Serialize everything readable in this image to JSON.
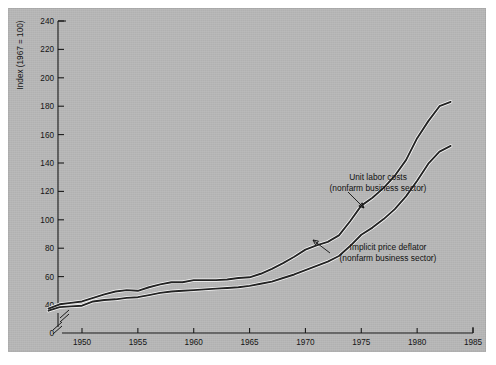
{
  "figure": {
    "background_color": "#b4b4b4",
    "page_color": "#ffffff"
  },
  "chart_data": {
    "type": "line",
    "title": "",
    "subtitle": "",
    "xlabel": "",
    "ylabel": "Index (1967 = 100)",
    "xlim": [
      1947,
      1985
    ],
    "ylim": [
      40,
      240
    ],
    "y_axis_break": true,
    "y_axis_break_label": "0",
    "grid": false,
    "legend": "none",
    "xticks": [
      1950,
      1955,
      1960,
      1965,
      1970,
      1975,
      1980,
      1985
    ],
    "xtick_labels": [
      "1950",
      "1955",
      "1960",
      "1965",
      "1970",
      "1975",
      "1980",
      "1985"
    ],
    "yticks": [
      40,
      60,
      80,
      100,
      120,
      140,
      160,
      180,
      200,
      220,
      240
    ],
    "ytick_labels": [
      "40",
      "60",
      "80",
      "100",
      "120",
      "140",
      "160",
      "180",
      "200",
      "220",
      "240"
    ],
    "zero_tick_label": "0",
    "x": [
      1947,
      1948,
      1949,
      1950,
      1951,
      1952,
      1953,
      1954,
      1955,
      1956,
      1957,
      1958,
      1959,
      1960,
      1961,
      1962,
      1963,
      1964,
      1965,
      1966,
      1967,
      1968,
      1969,
      1970,
      1971,
      1972,
      1973,
      1974,
      1975,
      1976,
      1977,
      1978,
      1979,
      1980,
      1981,
      1982,
      1983
    ],
    "series": [
      {
        "name": "Unit labor costs (nonfarm business sector)",
        "style": "white-highlighted dark line (upper)",
        "values": [
          37.5,
          40.5,
          41.5,
          42.5,
          45.0,
          47.5,
          49.5,
          50.5,
          50.0,
          52.5,
          54.5,
          56.0,
          56.0,
          57.5,
          57.5,
          57.5,
          58.0,
          59.0,
          59.5,
          62.0,
          65.5,
          69.5,
          74.0,
          79.0,
          82.0,
          84.5,
          89.0,
          99.0,
          110.0,
          115.5,
          122.5,
          131.0,
          142.0,
          157.5,
          169.5,
          180.0,
          183.0
        ]
      },
      {
        "name": "Implicit price deflator (nonfarm business sector)",
        "style": "dark line (lower)",
        "values": [
          36.0,
          38.5,
          39.0,
          39.5,
          42.5,
          43.5,
          44.0,
          45.0,
          45.5,
          47.0,
          48.5,
          49.5,
          50.0,
          50.5,
          51.0,
          51.5,
          52.0,
          52.5,
          53.5,
          55.0,
          56.5,
          59.0,
          61.5,
          64.5,
          67.5,
          70.5,
          74.5,
          81.5,
          89.5,
          94.5,
          100.5,
          107.5,
          116.5,
          127.5,
          139.5,
          148.0,
          152.0
        ]
      }
    ],
    "annotations": [
      {
        "id": "unit-labor-costs",
        "line1": "Unit labor costs",
        "line2": "(nonfarm business sector)",
        "text_x": 378,
        "text_y": 180,
        "arrow_from_x": 348,
        "arrow_from_y": 192,
        "arrow_to_x": 364,
        "arrow_to_y": 208
      },
      {
        "id": "implicit-price-deflator",
        "line1": "Implicit price deflator",
        "line2": "(nonfarm business sector)",
        "text_x": 388,
        "text_y": 250,
        "arrow_from_x": 330,
        "arrow_from_y": 253,
        "arrow_to_x": 313,
        "arrow_to_y": 240
      }
    ]
  }
}
